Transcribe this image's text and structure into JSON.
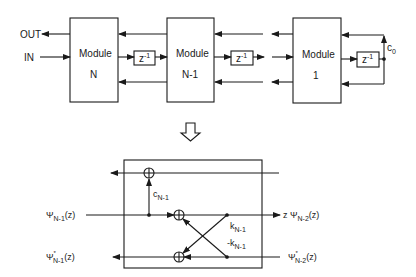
{
  "top_diagram": {
    "ports": {
      "out": "OUT",
      "in": "IN"
    },
    "modules": [
      {
        "title": "Module",
        "index": "N"
      },
      {
        "title": "Module",
        "index": "N-1"
      },
      {
        "title": "Module",
        "index": "1"
      }
    ],
    "delays": [
      {
        "base": "z",
        "exp": "-1"
      },
      {
        "base": "z",
        "exp": "-1"
      },
      {
        "base": "z",
        "exp": "-1"
      }
    ],
    "coefficient": {
      "base": "c",
      "sub": "0"
    }
  },
  "expand_arrow": "expand-down-arrow",
  "bottom_diagram": {
    "coef_c": {
      "base": "c",
      "sub": "N-1"
    },
    "coef_k": {
      "base": "k",
      "sub": "N-1"
    },
    "coef_negk": {
      "base": "-k",
      "sub": "N-1"
    },
    "left_in": {
      "base": "Ψ",
      "sub": "N-1",
      "tail": "(z)"
    },
    "left_out": {
      "base": "Ψ",
      "sup": "*",
      "sub": "N-1",
      "tail": "(z)"
    },
    "right_out": {
      "pre": "z Ψ",
      "sub": "N-2",
      "tail": "(z)"
    },
    "right_in": {
      "base": "Ψ",
      "sup": "*",
      "sub": "N-2",
      "tail": "(z)"
    }
  }
}
